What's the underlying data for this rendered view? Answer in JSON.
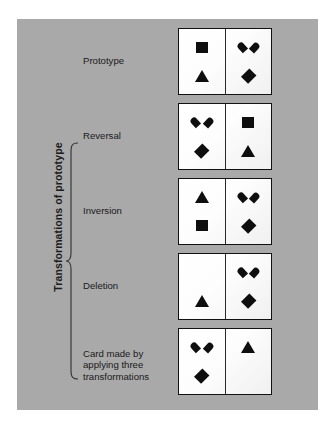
{
  "figure": {
    "background_color": "#ffffff",
    "panel_color": "#a9a9a9",
    "shape_color": "#0e0e0e",
    "card_face_color": "#fbfbfb",
    "axis_label": "Transformations of prototype"
  },
  "rows": [
    {
      "label": "Prototype",
      "label_lines": [
        "Prototype"
      ],
      "in_brace": false,
      "card": {
        "left": {
          "top": "square",
          "bottom": "triangle"
        },
        "right": {
          "top": "heart",
          "bottom": "diamond"
        }
      }
    },
    {
      "label": "Reversal",
      "label_lines": [
        "Reversal"
      ],
      "in_brace": true,
      "card": {
        "left": {
          "top": "heart",
          "bottom": "diamond"
        },
        "right": {
          "top": "square",
          "bottom": "triangle"
        }
      }
    },
    {
      "label": "Inversion",
      "label_lines": [
        "Inversion"
      ],
      "in_brace": true,
      "card": {
        "left": {
          "top": "triangle",
          "bottom": "square"
        },
        "right": {
          "top": "heart",
          "bottom": "diamond"
        }
      }
    },
    {
      "label": "Deletion",
      "label_lines": [
        "Deletion"
      ],
      "in_brace": true,
      "card": {
        "left": {
          "top": "none",
          "bottom": "triangle"
        },
        "right": {
          "top": "heart",
          "bottom": "diamond"
        }
      }
    },
    {
      "label": "Card made by applying three transformations",
      "label_lines": [
        "Card made by",
        "applying three",
        "transformations"
      ],
      "in_brace": true,
      "card": {
        "left": {
          "top": "heart",
          "bottom": "diamond"
        },
        "right": {
          "top": "triangle",
          "bottom": "none"
        }
      }
    }
  ]
}
